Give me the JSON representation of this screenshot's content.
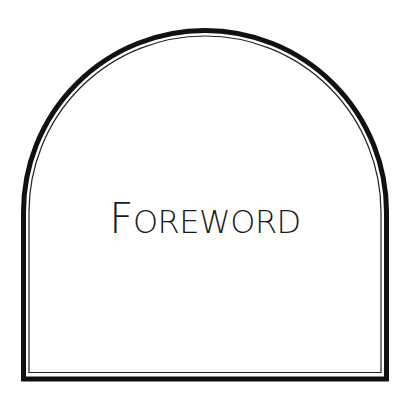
{
  "page": {
    "title_first_letter": "F",
    "title_rest": "OREWORD",
    "title_full": "Foreword"
  },
  "frame": {
    "shape": "round-top-arch",
    "border": "double-line",
    "outer_color": "#111111",
    "inner_color": "#222222"
  }
}
